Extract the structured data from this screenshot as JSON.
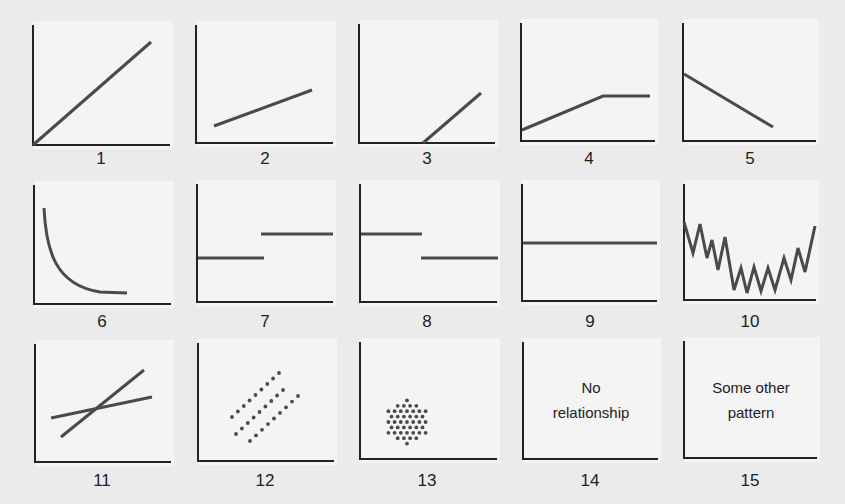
{
  "figure": {
    "title": "",
    "colors": {
      "background": "#ebebeb",
      "panel": "#f4f4f4",
      "axis": "#222222",
      "line": "#4a4a4a",
      "text": "#222222"
    },
    "panels": [
      {
        "id": 1,
        "label": "1",
        "pattern": "positive linear from origin"
      },
      {
        "id": 2,
        "label": "2",
        "pattern": "positive linear, shallow slope, nonzero intercept"
      },
      {
        "id": 3,
        "label": "3",
        "pattern": "zero then positive linear (threshold)"
      },
      {
        "id": 4,
        "label": "4",
        "pattern": "positive linear then plateau"
      },
      {
        "id": 5,
        "label": "5",
        "pattern": "negative linear"
      },
      {
        "id": 6,
        "label": "6",
        "pattern": "decaying curve"
      },
      {
        "id": 7,
        "label": "7",
        "pattern": "step up"
      },
      {
        "id": 8,
        "label": "8",
        "pattern": "step down"
      },
      {
        "id": 9,
        "label": "9",
        "pattern": "flat horizontal line"
      },
      {
        "id": 10,
        "label": "10",
        "pattern": "noisy U-shaped zigzag"
      },
      {
        "id": 11,
        "label": "11",
        "pattern": "two crossing lines"
      },
      {
        "id": 12,
        "label": "12",
        "pattern": "three parallel dotted bands"
      },
      {
        "id": 13,
        "label": "13",
        "pattern": "circular dot cluster"
      },
      {
        "id": 14,
        "label": "14",
        "pattern": "text",
        "text_lines": [
          "No",
          "relationship"
        ]
      },
      {
        "id": 15,
        "label": "15",
        "pattern": "text",
        "text_lines": [
          "Some other",
          "pattern"
        ]
      }
    ]
  },
  "chart_data": {
    "type": "diagram",
    "title": "",
    "layout": {
      "rows": 3,
      "cols": 5
    },
    "panels": [
      {
        "label": "1",
        "series": [
          {
            "x": [
              0,
              1
            ],
            "y": [
              0,
              1
            ]
          }
        ]
      },
      {
        "label": "2",
        "series": [
          {
            "x": [
              0.1,
              0.85
            ],
            "y": [
              0.15,
              0.45
            ]
          }
        ]
      },
      {
        "label": "3",
        "series": [
          {
            "x": [
              0.47,
              0.9
            ],
            "y": [
              0,
              0.42
            ]
          }
        ]
      },
      {
        "label": "4",
        "series": [
          {
            "x": [
              0,
              0.6,
              0.95
            ],
            "y": [
              0.1,
              0.38,
              0.38
            ]
          }
        ]
      },
      {
        "label": "5",
        "series": [
          {
            "x": [
              0,
              0.68
            ],
            "y": [
              0.57,
              0.12
            ]
          }
        ]
      },
      {
        "label": "6",
        "series": [
          {
            "x": [
              0.07,
              0.15,
              0.3,
              0.5,
              0.7
            ],
            "y": [
              0.8,
              0.4,
              0.2,
              0.12,
              0.09
            ]
          }
        ]
      },
      {
        "label": "7",
        "series": [
          {
            "x": [
              0,
              0.48
            ],
            "y": [
              0.38,
              0.38
            ]
          },
          {
            "x": [
              0.47,
              1
            ],
            "y": [
              0.58,
              0.58
            ]
          }
        ]
      },
      {
        "label": "8",
        "series": [
          {
            "x": [
              0,
              0.45
            ],
            "y": [
              0.58,
              0.58
            ]
          },
          {
            "x": [
              0.45,
              1
            ],
            "y": [
              0.38,
              0.38
            ]
          }
        ]
      },
      {
        "label": "9",
        "series": [
          {
            "x": [
              0,
              1
            ],
            "y": [
              0.5,
              0.5
            ]
          }
        ]
      },
      {
        "label": "10",
        "series": [
          {
            "x": [
              0,
              0.07,
              0.12,
              0.17,
              0.21,
              0.26,
              0.31,
              0.38,
              0.43,
              0.48,
              0.53,
              0.58,
              0.64,
              0.69,
              0.76,
              0.81,
              0.87,
              0.92,
              1.0
            ],
            "y": [
              0.68,
              0.42,
              0.66,
              0.37,
              0.52,
              0.27,
              0.55,
              0.11,
              0.29,
              0.08,
              0.3,
              0.1,
              0.29,
              0.11,
              0.37,
              0.18,
              0.45,
              0.25,
              0.64
            ]
          }
        ]
      },
      {
        "label": "11",
        "series": [
          {
            "x": [
              0.12,
              0.87
            ],
            "y": [
              0.37,
              0.55
            ]
          },
          {
            "x": [
              0.19,
              0.81
            ],
            "y": [
              0.21,
              0.78
            ]
          }
        ]
      },
      {
        "label": "12",
        "series": [
          {
            "type": "scatter",
            "band": 1
          },
          {
            "type": "scatter",
            "band": 2
          },
          {
            "type": "scatter",
            "band": 3
          }
        ]
      },
      {
        "label": "13",
        "series": [
          {
            "type": "scatter",
            "shape": "circular cluster"
          }
        ]
      },
      {
        "label": "14",
        "annotation": "No relationship"
      },
      {
        "label": "15",
        "annotation": "Some other pattern"
      }
    ]
  }
}
